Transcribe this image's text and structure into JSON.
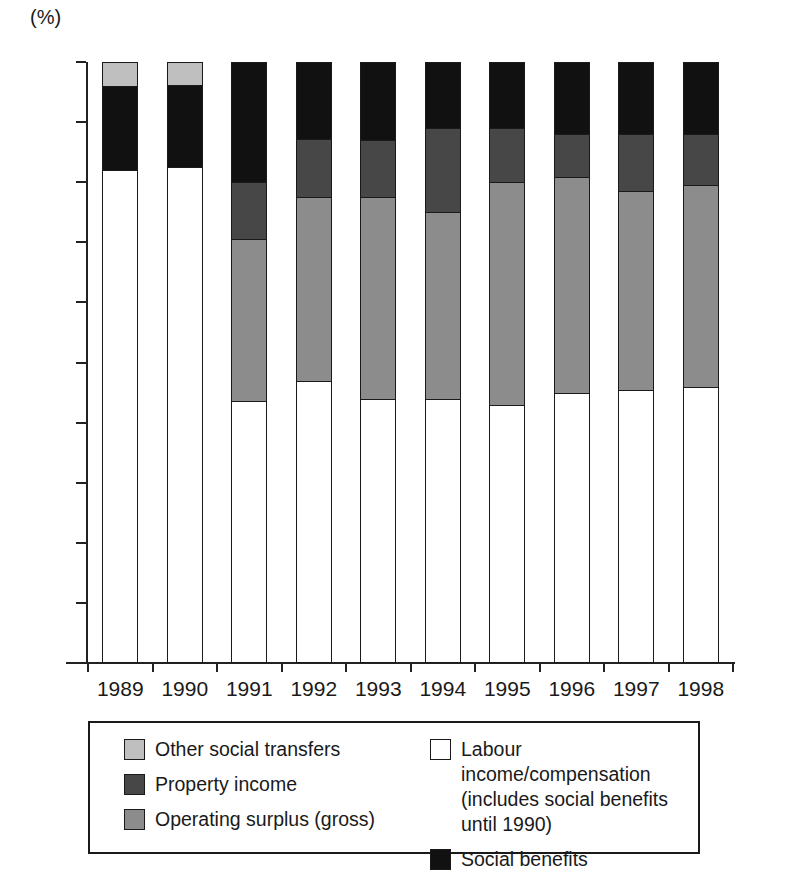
{
  "axis": {
    "unit_label": "(%)",
    "y_ticks": [
      "100",
      "90",
      "80",
      "70",
      "60",
      "50",
      "40",
      "30",
      "20",
      "10",
      "0"
    ],
    "y_tick_values": [
      100,
      90,
      80,
      70,
      60,
      50,
      40,
      30,
      20,
      10,
      0
    ]
  },
  "legend": {
    "left_column": [
      {
        "label": "Other social transfers",
        "color": "#bfbfbf",
        "key": "other_social_transfers"
      },
      {
        "label": "Property income",
        "color": "#474747",
        "key": "property_income"
      },
      {
        "label": "Operating surplus (gross)",
        "color": "#8c8c8c",
        "key": "operating_surplus"
      }
    ],
    "right_column": [
      {
        "label": "Labour income/compensation\n(includes social benefits\nuntil 1990)",
        "color": "#ffffff",
        "key": "labour_income"
      },
      {
        "label": "Social benefits",
        "color": "#111111",
        "key": "social_benefits"
      }
    ]
  },
  "chart_data": {
    "type": "bar",
    "subtype": "stacked-vertical-100pct",
    "title": "",
    "xlabel": "",
    "ylabel": "(%)",
    "ylim": [
      0,
      100
    ],
    "ytick_step": 10,
    "grid": false,
    "legend_position": "bottom",
    "categories": [
      "1989",
      "1990",
      "1991",
      "1992",
      "1993",
      "1994",
      "1995",
      "1996",
      "1997",
      "1998"
    ],
    "series": [
      {
        "name": "Labour income/compensation (includes social benefits until 1990)",
        "key": "labour_income",
        "color": "#ffffff",
        "values": [
          82.0,
          82.5,
          43.6,
          47.0,
          44.0,
          43.9,
          42.9,
          45.0,
          45.5,
          46.0
        ]
      },
      {
        "name": "Operating surplus (gross)",
        "key": "operating_surplus",
        "color": "#8c8c8c",
        "values": [
          0,
          0,
          26.9,
          30.5,
          33.5,
          31.1,
          37.1,
          35.8,
          33.0,
          33.5
        ]
      },
      {
        "name": "Property income",
        "key": "property_income",
        "color": "#474747",
        "values": [
          0,
          0,
          9.5,
          9.7,
          9.5,
          14.0,
          9.0,
          7.2,
          9.5,
          8.5
        ]
      },
      {
        "name": "Social benefits",
        "key": "social_benefits",
        "color": "#111111",
        "values": [
          14.0,
          13.7,
          20.0,
          12.8,
          13.0,
          11.0,
          11.0,
          12.0,
          12.0,
          12.0
        ]
      },
      {
        "name": "Other social transfers",
        "key": "other_social_transfers",
        "color": "#bfbfbf",
        "values": [
          4.0,
          3.8,
          0,
          0,
          0,
          0,
          0,
          0,
          0,
          0
        ]
      }
    ],
    "stack_order": [
      "labour_income",
      "operating_surplus",
      "property_income",
      "social_benefits",
      "other_social_transfers"
    ],
    "cumulative_tops": {
      "1989": {
        "labour_income": 82.0,
        "social_benefits": 96.0,
        "other_social_transfers": 100.0
      },
      "1990": {
        "labour_income": 82.5,
        "social_benefits": 96.2,
        "other_social_transfers": 100.0
      },
      "1991": {
        "labour_income": 43.6,
        "operating_surplus": 70.5,
        "property_income": 80.0,
        "social_benefits": 100.0
      },
      "1992": {
        "labour_income": 47.0,
        "operating_surplus": 77.5,
        "property_income": 87.2,
        "social_benefits": 100.0
      },
      "1993": {
        "labour_income": 44.0,
        "operating_surplus": 77.5,
        "property_income": 87.0,
        "social_benefits": 100.0
      },
      "1994": {
        "labour_income": 43.9,
        "operating_surplus": 75.0,
        "property_income": 89.0,
        "social_benefits": 100.0
      },
      "1995": {
        "labour_income": 42.9,
        "operating_surplus": 80.0,
        "property_income": 89.0,
        "social_benefits": 100.0
      },
      "1996": {
        "labour_income": 45.0,
        "operating_surplus": 80.8,
        "property_income": 88.0,
        "social_benefits": 100.0
      },
      "1997": {
        "labour_income": 45.5,
        "operating_surplus": 78.5,
        "property_income": 88.0,
        "social_benefits": 100.0
      },
      "1998": {
        "labour_income": 46.0,
        "operating_surplus": 79.5,
        "property_income": 88.0,
        "social_benefits": 100.0
      }
    }
  }
}
